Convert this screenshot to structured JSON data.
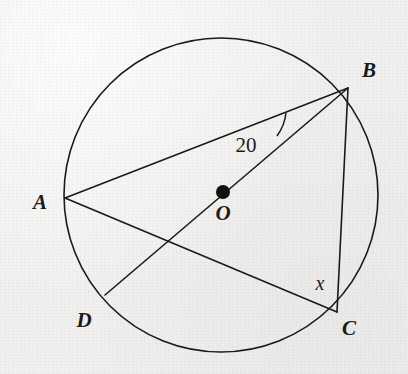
{
  "figure": {
    "width": 408,
    "height": 374,
    "background_color": "#f2f1ef",
    "ink_color": "#1a1a1a",
    "stroke_width": 1.6
  },
  "circle": {
    "name": "circle-O",
    "center_x": 221,
    "center_y": 195,
    "radius": 157
  },
  "center_point": {
    "label": "O",
    "x": 223,
    "y": 192,
    "dot_radius": 7,
    "label_x": 223,
    "label_y": 213
  },
  "points": [
    {
      "label": "A",
      "x": 65,
      "y": 198,
      "label_x": 40,
      "label_y": 202
    },
    {
      "label": "B",
      "x": 348,
      "y": 88,
      "label_x": 369,
      "label_y": 70
    },
    {
      "label": "C",
      "x": 337,
      "y": 312,
      "label_x": 349,
      "label_y": 328
    },
    {
      "label": "D",
      "x": 105,
      "y": 295,
      "label_x": 84,
      "label_y": 320
    }
  ],
  "chords": [
    {
      "name": "chord-AB",
      "from": "A",
      "to": "B",
      "x1": 65,
      "y1": 198,
      "x2": 348,
      "y2": 88
    },
    {
      "name": "chord-AC",
      "from": "A",
      "to": "C",
      "x1": 65,
      "y1": 198,
      "x2": 337,
      "y2": 312
    },
    {
      "name": "chord-BC",
      "from": "B",
      "to": "C",
      "x1": 348,
      "y1": 88,
      "x2": 337,
      "y2": 312
    },
    {
      "name": "diameter-BD",
      "from": "B",
      "to": "D",
      "x1": 348,
      "y1": 88,
      "x2": 105,
      "y2": 295
    }
  ],
  "angles": [
    {
      "name": "angle-ABD",
      "label": "20",
      "vertex": "B",
      "label_x": 246,
      "label_y": 145,
      "arc_path": "M 286 113 A 48 48 0 0 1 277 136"
    },
    {
      "name": "angle-BCA",
      "label": "x",
      "vertex": "C",
      "label_x": 320,
      "label_y": 283,
      "arc_path": ""
    }
  ]
}
